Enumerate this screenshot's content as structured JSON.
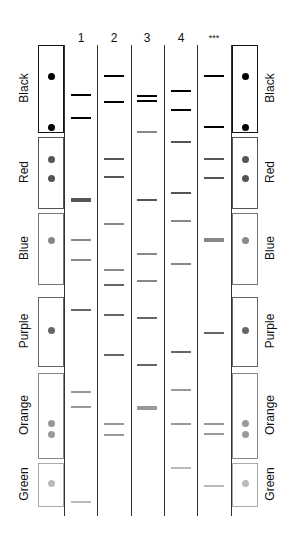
{
  "lane_labels": [
    "1",
    "2",
    "3",
    "4",
    "***"
  ],
  "key": [
    {
      "label": "Black",
      "color": "#000000",
      "border": "#111111",
      "top": 45,
      "bottom": 133,
      "dots": [
        76,
        127
      ]
    },
    {
      "label": "Red",
      "color": "#555555",
      "border": "#555555",
      "top": 137,
      "bottom": 209,
      "dots": [
        159,
        178
      ]
    },
    {
      "label": "Blue",
      "color": "#888888",
      "border": "#777777",
      "top": 213,
      "bottom": 285,
      "dots": [
        240
      ]
    },
    {
      "label": "Purple",
      "color": "#666666",
      "border": "#666666",
      "top": 297,
      "bottom": 367,
      "dots": [
        330
      ]
    },
    {
      "label": "Orange",
      "color": "#999999",
      "border": "#888888",
      "top": 373,
      "bottom": 459,
      "dots": [
        423,
        434
      ]
    },
    {
      "label": "Green",
      "color": "#bbbbbb",
      "border": "#aaaaaa",
      "top": 463,
      "bottom": 507,
      "dots": [
        483
      ]
    }
  ],
  "chart_data": {
    "type": "gel-diagram",
    "title": "",
    "lanes": [
      "1",
      "2",
      "3",
      "4",
      "***"
    ],
    "key_categories": [
      "Black",
      "Red",
      "Blue",
      "Purple",
      "Orange",
      "Green"
    ],
    "bands": {
      "1": [
        {
          "y": 95,
          "shade": "Black"
        },
        {
          "y": 118,
          "shade": "Black"
        },
        {
          "y": 200,
          "shade": "Red",
          "thick": true
        },
        {
          "y": 240,
          "shade": "Blue"
        },
        {
          "y": 260,
          "shade": "Blue"
        },
        {
          "y": 310,
          "shade": "Purple"
        },
        {
          "y": 392,
          "shade": "Orange"
        },
        {
          "y": 407,
          "shade": "Orange"
        },
        {
          "y": 502,
          "shade": "Green"
        }
      ],
      "2": [
        {
          "y": 76,
          "shade": "Black"
        },
        {
          "y": 102,
          "shade": "Black"
        },
        {
          "y": 159,
          "shade": "Red"
        },
        {
          "y": 177,
          "shade": "Red"
        },
        {
          "y": 224,
          "shade": "Blue"
        },
        {
          "y": 270,
          "shade": "Blue"
        },
        {
          "y": 285,
          "shade": "Purple"
        },
        {
          "y": 315,
          "shade": "Purple"
        },
        {
          "y": 355,
          "shade": "Purple"
        },
        {
          "y": 424,
          "shade": "Orange"
        },
        {
          "y": 435,
          "shade": "Orange"
        }
      ],
      "3": [
        {
          "y": 96,
          "shade": "Black"
        },
        {
          "y": 101,
          "shade": "Black"
        },
        {
          "y": 132,
          "shade": "Blue"
        },
        {
          "y": 200,
          "shade": "Red"
        },
        {
          "y": 254,
          "shade": "Blue"
        },
        {
          "y": 281,
          "shade": "Blue"
        },
        {
          "y": 318,
          "shade": "Purple"
        },
        {
          "y": 365,
          "shade": "Purple"
        },
        {
          "y": 408,
          "shade": "Orange",
          "thick": true
        }
      ],
      "4": [
        {
          "y": 91,
          "shade": "Black"
        },
        {
          "y": 110,
          "shade": "Black"
        },
        {
          "y": 142,
          "shade": "Red"
        },
        {
          "y": 193,
          "shade": "Red"
        },
        {
          "y": 221,
          "shade": "Blue"
        },
        {
          "y": 264,
          "shade": "Blue"
        },
        {
          "y": 352,
          "shade": "Purple"
        },
        {
          "y": 390,
          "shade": "Orange"
        },
        {
          "y": 424,
          "shade": "Orange"
        },
        {
          "y": 468,
          "shade": "Green"
        }
      ],
      "***": [
        {
          "y": 76,
          "shade": "Black"
        },
        {
          "y": 127,
          "shade": "Black"
        },
        {
          "y": 159,
          "shade": "Red"
        },
        {
          "y": 178,
          "shade": "Red"
        },
        {
          "y": 240,
          "shade": "Blue",
          "thick": true
        },
        {
          "y": 333,
          "shade": "Purple"
        },
        {
          "y": 424,
          "shade": "Orange"
        },
        {
          "y": 434,
          "shade": "Orange"
        },
        {
          "y": 486,
          "shade": "Green"
        }
      ]
    }
  }
}
